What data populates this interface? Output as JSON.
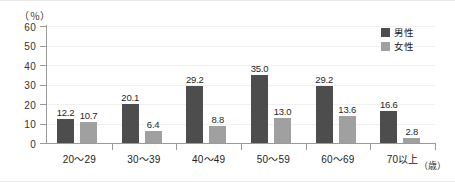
{
  "chart_data": {
    "type": "bar",
    "title": "",
    "subtitle": "",
    "xlabel": "（歳）",
    "ylabel": "（％）",
    "categories": [
      "20〜29",
      "30〜39",
      "40〜49",
      "50〜59",
      "60〜69",
      "70以上"
    ],
    "series": [
      {
        "name": "男性",
        "color": "#4d4d4d",
        "values": [
          12.2,
          20.1,
          29.2,
          35.0,
          29.2,
          16.6
        ],
        "labels": [
          "12.2",
          "20.1",
          "29.2",
          "35.0",
          "29.2",
          "16.6"
        ]
      },
      {
        "name": "女性",
        "color": "#a0a0a0",
        "values": [
          10.7,
          6.4,
          8.8,
          13.0,
          13.6,
          2.8
        ],
        "labels": [
          "10.7",
          "6.4",
          "8.8",
          "13.0",
          "13.6",
          "2.8"
        ]
      }
    ],
    "ylim": [
      0,
      60
    ],
    "yticks": [
      0,
      10,
      20,
      30,
      40,
      50,
      60
    ],
    "ytick_labels": [
      "0",
      "10",
      "20",
      "30",
      "40",
      "50",
      "60"
    ],
    "grid": true,
    "grid_axis": "y",
    "legend_position": "top-right"
  },
  "axis": {
    "unit_y": "（％）",
    "unit_x": "（歳）"
  },
  "legend": {
    "items": [
      {
        "label": "男性",
        "color": "#4d4d4d"
      },
      {
        "label": "女性",
        "color": "#a0a0a0"
      }
    ]
  }
}
